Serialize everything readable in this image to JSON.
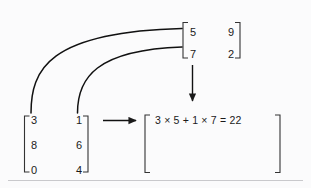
{
  "figure": {
    "type": "matrix-multiplication-diagram",
    "background_color": "#fbfbfc",
    "ink_color": "#1a1a1a",
    "rule_color": "#c9c9cc"
  },
  "left_matrix": {
    "name": "left-matrix",
    "rows": 3,
    "cols": 2,
    "values": [
      [
        "3",
        "1"
      ],
      [
        "8",
        "6"
      ],
      [
        "0",
        "4"
      ]
    ],
    "cells": {
      "r0c0": "3",
      "r0c1": "1",
      "r1c0": "8",
      "r1c1": "6",
      "r2c0": "0",
      "r2c1": "4"
    }
  },
  "right_matrix": {
    "name": "right-matrix",
    "rows": 2,
    "cols": 2,
    "values": [
      [
        "5",
        "9"
      ],
      [
        "7",
        "2"
      ]
    ],
    "cells": {
      "r0c0": "5",
      "r0c1": "9",
      "r1c0": "7",
      "r1c1": "2"
    }
  },
  "result_matrix": {
    "name": "result-matrix",
    "equation": "3 × 5 + 1 × 7 = 22",
    "terms": {
      "a": "3",
      "b": "5",
      "c": "1",
      "d": "7",
      "product": "22"
    }
  },
  "connectors": {
    "arc_top_label": "row-1-to-column-1-arc",
    "arc_bottom_label": "row-1-to-column-2-arc",
    "horizontal_arrow_label": "left-matrix-to-result-arrow",
    "vertical_arrow_label": "right-matrix-to-result-arrow"
  }
}
